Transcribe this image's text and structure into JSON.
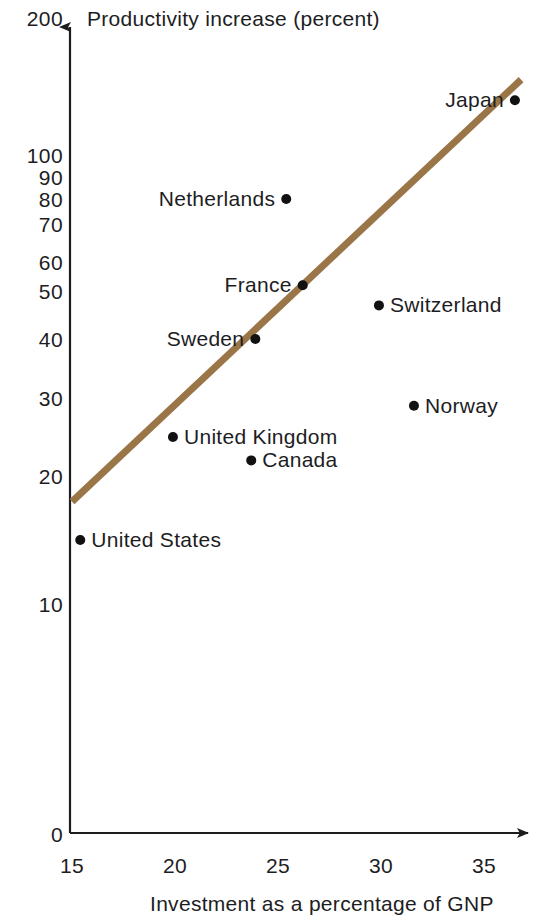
{
  "chart_data": {
    "type": "scatter",
    "title": "Productivity increase (percent)",
    "xlabel": "Investment as a percentage of GNP",
    "ylabel": "Productivity increase (percent)",
    "x_ticks": [
      "15",
      "20",
      "25",
      "30",
      "35"
    ],
    "y_ticks": [
      "200",
      "100",
      "90",
      "80",
      "70",
      "60",
      "50",
      "40",
      "30",
      "20",
      "10",
      "0"
    ],
    "y_scale": "log-like (broken at 0)",
    "xlim": [
      15,
      36.5
    ],
    "ylim": [
      0,
      200
    ],
    "grid": false,
    "legend": "none",
    "line_color": "#9a7547",
    "point_color": "#111111",
    "trendline": {
      "label": "trend line",
      "x_start": 15.0,
      "y_start": 18,
      "x_end": 36.8,
      "y_end": 155
    },
    "points": [
      {
        "name": "United States",
        "x": 15.4,
        "y": 15,
        "label_side": "right"
      },
      {
        "name": "United Kingdom",
        "x": 19.9,
        "y": 25,
        "label_side": "right"
      },
      {
        "name": "Sweden",
        "x": 23.9,
        "y": 40,
        "label_side": "left"
      },
      {
        "name": "Canada",
        "x": 23.7,
        "y": 22,
        "label_side": "right"
      },
      {
        "name": "Netherlands",
        "x": 25.4,
        "y": 80,
        "label_side": "left"
      },
      {
        "name": "France",
        "x": 26.2,
        "y": 52,
        "label_side": "left"
      },
      {
        "name": "Switzerland",
        "x": 29.9,
        "y": 47,
        "label_side": "right"
      },
      {
        "name": "Norway",
        "x": 31.6,
        "y": 29,
        "label_side": "right"
      },
      {
        "name": "Japan",
        "x": 36.5,
        "y": 140,
        "label_side": "left"
      }
    ]
  },
  "axes": {
    "x_axis_name": "investment-axis",
    "y_axis_name": "productivity-axis"
  }
}
